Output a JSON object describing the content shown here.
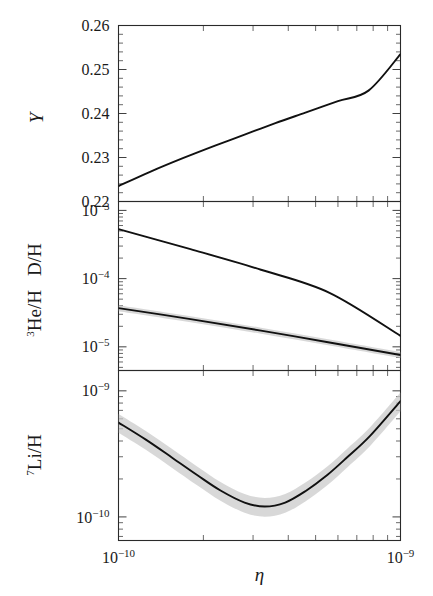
{
  "figure": {
    "kind": "multi-panel-scientific-plot",
    "background": "#ffffff",
    "ink_color": "#111111",
    "band_color": "#c9c9c9"
  },
  "xaxis": {
    "label": "η",
    "scale": "log",
    "min": 1e-10,
    "max": 1e-09,
    "tick_labels": [
      "10−10",
      "10−9"
    ],
    "tick_mantissa": [
      "10",
      "10"
    ],
    "tick_exponents": [
      "−10",
      "−9"
    ],
    "minor_ticks": [
      2,
      3,
      4,
      5,
      6,
      7,
      8,
      9
    ]
  },
  "chart_data": [
    {
      "type": "line",
      "panel": "top",
      "title": "",
      "ylabel": "Y",
      "xlabel": "η",
      "yscale": "linear",
      "xscale": "log",
      "ylim": [
        0.22,
        0.26
      ],
      "xlim": [
        1e-10,
        1e-09
      ],
      "ytick_labels": [
        "0.22",
        "0.23",
        "0.24",
        "0.25",
        "0.26"
      ],
      "ytick_values": [
        0.22,
        0.23,
        0.24,
        0.25,
        0.26
      ],
      "grid": false,
      "legend": "none",
      "series": [
        {
          "name": "Y",
          "has_band": false,
          "x": [
            1e-10,
            1.3e-10,
            1.7e-10,
            2.2e-10,
            2.8e-10,
            3.6e-10,
            4.6e-10,
            6e-10,
            7.7e-10,
            1e-09
          ],
          "y": [
            0.2235,
            0.2268,
            0.2299,
            0.2327,
            0.2352,
            0.2378,
            0.2402,
            0.2428,
            0.2452,
            0.2535
          ]
        }
      ]
    },
    {
      "type": "line",
      "panel": "middle",
      "title": "",
      "ylabel": "³He/H   D/H",
      "xlabel": "η",
      "yscale": "log",
      "xscale": "log",
      "ylim": [
        4.5e-06,
        0.00135
      ],
      "xlim": [
        1e-10,
        1e-09
      ],
      "ytick_labels": [
        "10−5",
        "10−4",
        "10−3"
      ],
      "ytick_values": [
        1e-05,
        0.0001,
        0.001
      ],
      "grid": false,
      "legend": "none",
      "series": [
        {
          "name": "D/H",
          "has_band": false,
          "x": [
            1e-10,
            1.8e-10,
            3.2e-10,
            5.6e-10,
            1e-09
          ],
          "y": [
            0.00053,
            0.00027,
            0.000135,
            6.2e-05,
            1.45e-05
          ]
        },
        {
          "name": "³He/H",
          "has_band": true,
          "band_rel_width": 0.1,
          "x": [
            1e-10,
            1.8e-10,
            3.2e-10,
            5.6e-10,
            1e-09
          ],
          "y": [
            3.7e-05,
            2.55e-05,
            1.73e-05,
            1.16e-05,
            7.6e-06
          ]
        }
      ]
    },
    {
      "type": "line",
      "panel": "bottom",
      "title": "",
      "ylabel": "⁷Li/H",
      "xlabel": "η",
      "yscale": "log",
      "xscale": "log",
      "ylim": [
        6.5e-11,
        1.45e-09
      ],
      "xlim": [
        1e-10,
        1e-09
      ],
      "ytick_labels": [
        "10−10",
        "10−9"
      ],
      "ytick_values": [
        1e-10,
        1e-09
      ],
      "grid": false,
      "legend": "none",
      "series": [
        {
          "name": "⁷Li/H",
          "has_band": true,
          "band_rel_width": 0.17,
          "x": [
            1e-10,
            1.25e-10,
            1.55e-10,
            1.9e-10,
            2.3e-10,
            2.8e-10,
            3.3e-10,
            3.9e-10,
            4.6e-10,
            5.5e-10,
            6.5e-10,
            7.8e-10,
            1e-09
          ],
          "y": [
            5.6e-10,
            4.1e-10,
            2.95e-10,
            2.15e-10,
            1.62e-10,
            1.3e-10,
            1.21e-10,
            1.3e-10,
            1.6e-10,
            2.15e-10,
            3e-10,
            4.4e-10,
            8.3e-10
          ]
        }
      ]
    }
  ]
}
